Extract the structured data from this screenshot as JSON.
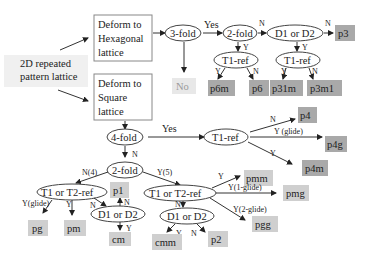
{
  "diagram": {
    "start": {
      "label_line1": "2D repeated",
      "label_line2": "pattern lattice"
    },
    "hex_box": {
      "line1": "Deform to",
      "line2": "Hexagonal",
      "line3": "lattice"
    },
    "sq_box": {
      "line1": "Deform to",
      "line2": "Square",
      "line3": "lattice"
    },
    "nodes": {
      "threefold": "3-fold",
      "twofold_hex": "2-fold",
      "d1d2_hex": "D1 or D2",
      "t1ref_a": "T1-ref",
      "t1ref_b": "T1-ref",
      "fourfold": "4-fold",
      "t1ref_sq": "T1-ref",
      "twofold_sq": "2-fold",
      "t1t2_left": "T1 or T2-ref",
      "d1d2_left": "D1 or D2",
      "t1t2_right": "T1 or T2-ref",
      "d1d2_right": "D1 or D2"
    },
    "results": {
      "no": "No",
      "p3": "p3",
      "p6m": "p6m",
      "p6": "p6",
      "p31m": "p31m",
      "p3m1": "p3m1",
      "p4": "p4",
      "p4g": "p4g",
      "p4m": "p4m",
      "pg": "pg",
      "pm": "pm",
      "p1": "p1",
      "cm": "cm",
      "pmm": "pmm",
      "pmg": "pmg",
      "pgg": "pgg",
      "cmm": "cmm",
      "p2": "p2"
    },
    "edge_labels": {
      "yes_3fold": "Yes",
      "n_2fold_hex": "N",
      "n_d1d2_hex": "N",
      "y_2fold_hex": "Y",
      "y_d1d2_hex": "Y",
      "y_t1a": "Y",
      "n_t1a": "N",
      "y_t1b": "Y",
      "n_t1b": "N",
      "yes_4fold": "Yes",
      "n_p4": "N",
      "yglide_p4g": "Y (glide)",
      "y_p4m": "Y",
      "n_4fold": "N",
      "n4": "N(4)",
      "y5": "Y(5)",
      "yglide_pg": "Y(glide)",
      "y_pm": "Y",
      "n_d1d2_left": "N",
      "n_p1": "N",
      "y_cm": "Y",
      "y_pmm": "Y",
      "y1glide": "Y(1-glide)",
      "y2glide": "Y(2-glide)",
      "n_right": "N",
      "y_cmm": "Y",
      "n_p2": "N"
    },
    "colors": {
      "result_fill": "#a9a9a9",
      "result_light_fill": "#cfcfcf",
      "no_fill": "#e8e8e8",
      "line": "#333333"
    }
  }
}
